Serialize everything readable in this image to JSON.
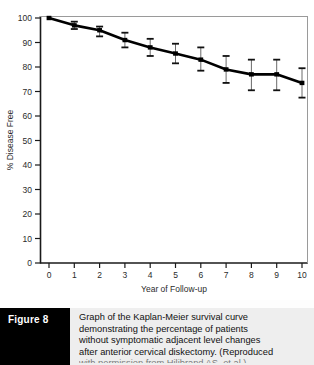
{
  "figure": {
    "tag_label": "Figure 8",
    "caption_lines": [
      "Graph of the Kaplan-Meier survival curve",
      "demonstrating the percentage of patients",
      "without symptomatic adjacent level changes",
      "after anterior cervical diskectomy. (Reproduced",
      "with permission from Hilibrand AS, et al.)"
    ]
  },
  "chart_data": {
    "type": "line",
    "title": "",
    "xlabel": "Year of Follow-up",
    "ylabel": "% Disease Free",
    "xlim": [
      0,
      10
    ],
    "ylim": [
      0,
      100
    ],
    "grid": false,
    "legend": "none",
    "x_ticks": [
      "0",
      "1",
      "2",
      "3",
      "4",
      "5",
      "6",
      "7",
      "8",
      "9",
      "10"
    ],
    "y_ticks": [
      "0",
      "10",
      "20",
      "30",
      "40",
      "50",
      "60",
      "70",
      "80",
      "90",
      "100"
    ],
    "x": [
      0,
      1,
      2,
      3,
      4,
      5,
      6,
      7,
      8,
      9,
      10
    ],
    "values": [
      100,
      97,
      95,
      91,
      88,
      85.5,
      83,
      79,
      77,
      77,
      73.5
    ],
    "error_low": [
      100,
      95.5,
      92.5,
      88,
      84.5,
      81.5,
      78.5,
      73.5,
      70.5,
      70.5,
      67.5
    ],
    "error_high": [
      100,
      98.5,
      96.5,
      94,
      91.5,
      89.5,
      88,
      84.5,
      83,
      83,
      79.5
    ],
    "series": [
      {
        "name": "Disease free survival",
        "values": [
          100,
          97,
          95,
          91,
          88,
          85.5,
          83,
          79,
          77,
          77,
          73.5
        ]
      }
    ],
    "colors": {
      "line": "#000000",
      "marker": "#000000",
      "errorbar": "#555555",
      "axis": "#1a1a1a",
      "background": "#ffffff"
    }
  }
}
